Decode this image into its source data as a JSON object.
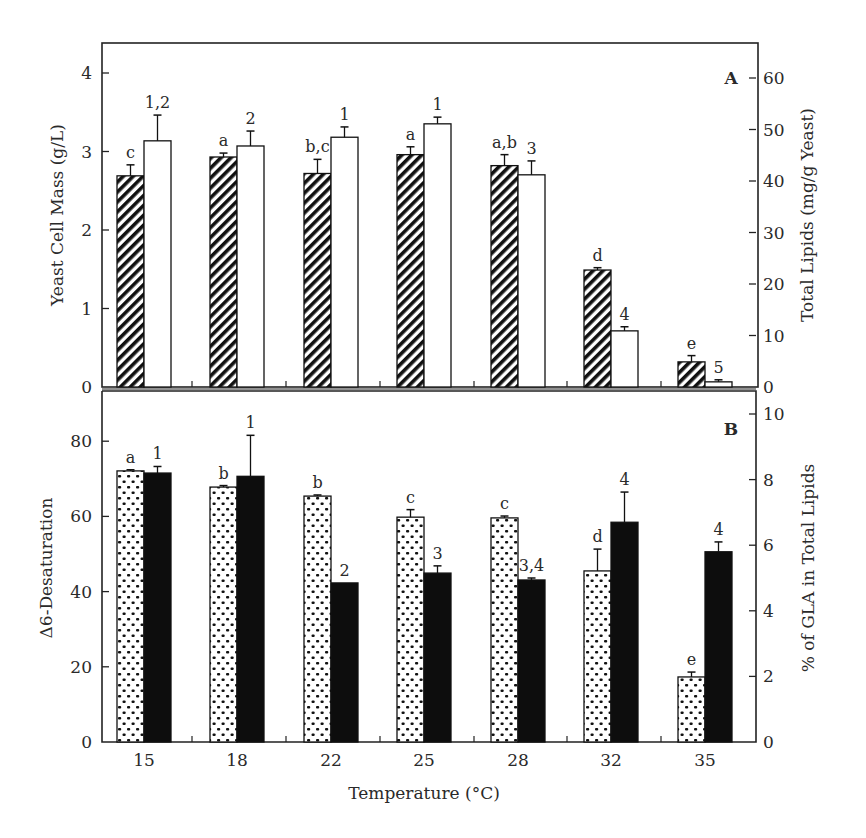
{
  "chart_data": [
    {
      "panel": "A",
      "type": "bar",
      "title": "",
      "panel_label": "A",
      "xlabel": "Temperature (°C)",
      "categories": [
        "15",
        "18",
        "22",
        "25",
        "28",
        "32",
        "35"
      ],
      "left_axis": {
        "label": "Yeast Cell Mass (g/L)",
        "ylim": [
          0,
          4.4
        ],
        "ticks": [
          0,
          1,
          2,
          3,
          4
        ]
      },
      "right_axis": {
        "label": "Total Lipids (mg/g Yeast)",
        "ylim": [
          0,
          66
        ],
        "ticks": [
          0,
          10,
          20,
          30,
          40,
          50,
          60
        ]
      },
      "series": [
        {
          "name": "Yeast Cell Mass",
          "axis": "left",
          "pattern": "diagonal-hatch",
          "values": [
            2.69,
            2.93,
            2.72,
            2.96,
            2.82,
            1.49,
            0.32
          ],
          "error": [
            0.14,
            0.05,
            0.18,
            0.1,
            0.14,
            0.03,
            0.08
          ],
          "annotations": [
            "c",
            "a",
            "b,c",
            "a",
            "a,b",
            "d",
            "e"
          ]
        },
        {
          "name": "Total Lipids",
          "axis": "right",
          "pattern": "white",
          "values": [
            47.8,
            46.8,
            48.5,
            51.1,
            41.2,
            10.9,
            1.0
          ],
          "error": [
            5.0,
            2.9,
            2.0,
            1.3,
            2.7,
            0.8,
            0.4
          ],
          "annotations": [
            "1,2",
            "2",
            "1",
            "1",
            "3",
            "4",
            "5"
          ]
        }
      ],
      "grid": false,
      "legend": "none"
    },
    {
      "panel": "B",
      "type": "bar",
      "title": "",
      "panel_label": "B",
      "xlabel": "Temperature (°C)",
      "categories": [
        "15",
        "18",
        "22",
        "25",
        "28",
        "32",
        "35"
      ],
      "left_axis": {
        "label": "Δ6-Desaturation",
        "ylim": [
          0,
          93
        ],
        "ticks": [
          0,
          20,
          40,
          60,
          80
        ]
      },
      "right_axis": {
        "label": "% of GLA in Total Lipids",
        "ylim": [
          0,
          10.6
        ],
        "ticks": [
          0,
          2,
          4,
          6,
          8,
          10
        ]
      },
      "series": [
        {
          "name": "Δ6-Desaturation",
          "axis": "left",
          "pattern": "dotted",
          "values": [
            72.1,
            67.8,
            65.4,
            59.8,
            59.6,
            45.5,
            17.3
          ],
          "error": [
            0.3,
            0.4,
            0.3,
            2.0,
            0.5,
            5.8,
            1.3
          ],
          "annotations": [
            "a",
            "b",
            "b",
            "c",
            "c",
            "d",
            "e"
          ]
        },
        {
          "name": "% of GLA in Total Lipids",
          "axis": "right",
          "pattern": "solid-black",
          "values": [
            8.2,
            8.1,
            4.85,
            5.15,
            4.94,
            6.7,
            5.8
          ],
          "error": [
            0.2,
            1.25,
            0.0,
            0.22,
            0.06,
            0.92,
            0.3
          ],
          "annotations": [
            "1",
            "1",
            "2",
            "3",
            "3,4",
            "4",
            "4"
          ]
        }
      ],
      "grid": false,
      "legend": "none"
    }
  ],
  "labels": {
    "xlabel": "Temperature (°C)",
    "panelA": {
      "letter": "A",
      "left_title": "Yeast Cell Mass (g/L)",
      "right_title": "Total Lipids (mg/g Yeast)",
      "left_ticks": [
        "0",
        "1",
        "2",
        "3",
        "4"
      ],
      "right_ticks": [
        "0",
        "10",
        "20",
        "30",
        "40",
        "50",
        "60"
      ]
    },
    "panelB": {
      "letter": "B",
      "left_title": "Δ6-Desaturation",
      "right_title": "% of GLA in Total Lipids",
      "left_ticks": [
        "0",
        "20",
        "40",
        "60",
        "80"
      ],
      "right_ticks": [
        "0",
        "2",
        "4",
        "6",
        "8",
        "10"
      ]
    },
    "categories": [
      "15",
      "18",
      "22",
      "25",
      "28",
      "32",
      "35"
    ]
  },
  "colors": {
    "ink": "#1a1a1a",
    "background": "#ffffff"
  }
}
